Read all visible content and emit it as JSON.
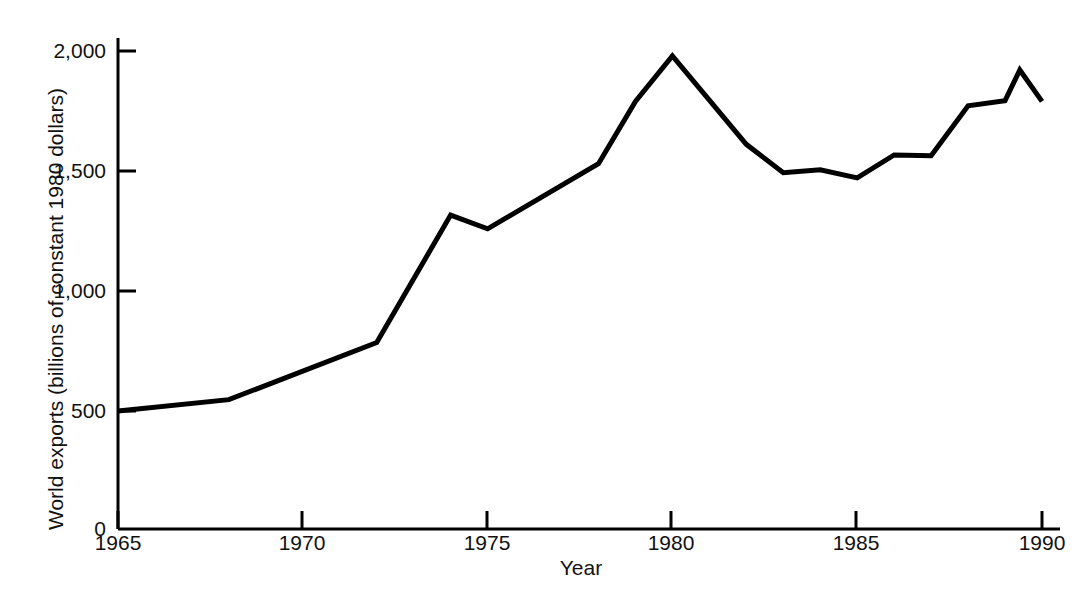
{
  "chart_data": {
    "type": "line",
    "title": "",
    "xlabel": "Year",
    "ylabel": "World exports (billions of constant 1980 dollars)",
    "xlim": [
      1964.0,
      1990.2
    ],
    "ylim": [
      0,
      2150
    ],
    "grid": false,
    "legend": null,
    "line_color": "#000000",
    "line_width": 5,
    "xticks": [
      1965,
      1970,
      1975,
      1980,
      1985,
      1990
    ],
    "xticklabels": [
      "1965",
      "1970",
      "1975",
      "1980",
      "1985",
      "1990"
    ],
    "yticks": [
      0,
      500,
      1000,
      1500,
      2000
    ],
    "yticklabels": [
      "0",
      "500",
      "1,000",
      "1,500",
      "2,000"
    ],
    "series": [
      {
        "name": "World exports",
        "x": [
          1965,
          1968,
          1972,
          1974,
          1975,
          1978,
          1979,
          1980,
          1982,
          1983,
          1984,
          1985,
          1986,
          1987,
          1988,
          1989,
          1989.4,
          1990
        ],
        "y": [
          500,
          548,
          790,
          1330,
          1272,
          1548,
          1812,
          2005,
          1630,
          1510,
          1522,
          1488,
          1585,
          1582,
          1793,
          1815,
          1945,
          1812
        ]
      }
    ]
  },
  "axes": {
    "y_title": "World exports (billions of constant 1980 dollars)",
    "x_title": "Year",
    "y_labels": [
      "2,000",
      "1,500",
      "1,000",
      "500",
      "0"
    ],
    "x_labels": [
      "1965",
      "1970",
      "1975",
      "1980",
      "1985",
      "1990"
    ]
  },
  "caption": {
    "ghost_text": ""
  }
}
